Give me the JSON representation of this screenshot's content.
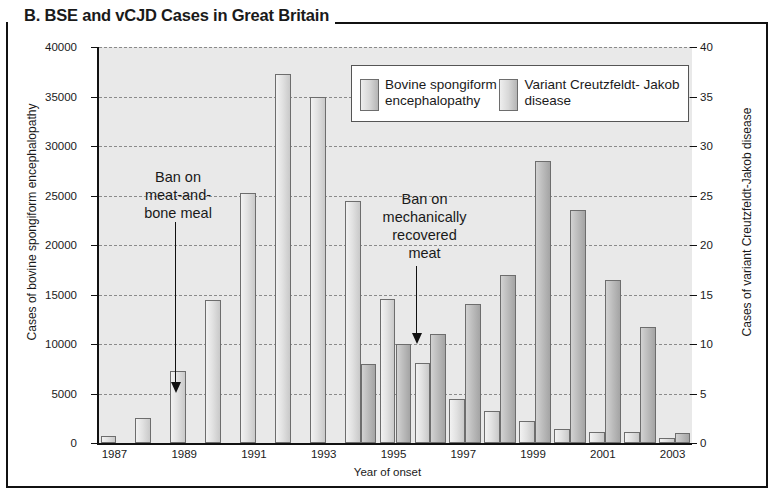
{
  "panel": {
    "title": "B. BSE and vCJD Cases in Great Britain"
  },
  "legend": {
    "items": [
      {
        "label": "Bovine spongiform\nencephalopathy",
        "key": "bse"
      },
      {
        "label": "Variant Creutzfeldt-\nJakob disease",
        "key": "vcjd"
      }
    ]
  },
  "annotations": [
    {
      "text": "Ban on\nmeat-and-\nbone meal",
      "name": "annotation-meat-and-bone-meal-ban",
      "year": 1988.6
    },
    {
      "text": "Ban on\nmechanically\nrecovered\nmeat",
      "name": "annotation-mechanically-recovered-meat-ban",
      "year": 1995.6
    }
  ],
  "chart_data": {
    "type": "bar",
    "title": "B. BSE and vCJD Cases in Great Britain",
    "xlabel": "Year of onset",
    "ylabel": "Cases of bovine spongiform encephalopathy",
    "ylabel_right": "Cases of variant Creutzfeldt-Jakob disease",
    "ylim": [
      0,
      40000
    ],
    "ylim_right": [
      0,
      40
    ],
    "yticks": [
      0,
      5000,
      10000,
      15000,
      20000,
      25000,
      30000,
      35000,
      40000
    ],
    "yticks_right": [
      0,
      5,
      10,
      15,
      20,
      25,
      30,
      35,
      40
    ],
    "xticks": [
      1987,
      1989,
      1991,
      1993,
      1995,
      1997,
      1999,
      2001,
      2003
    ],
    "grid": true,
    "legend_position": "top-right",
    "categories": [
      1987,
      1988,
      1989,
      1990,
      1991,
      1992,
      1993,
      1994,
      1995,
      1996,
      1997,
      1998,
      1999,
      2000,
      2001,
      2002,
      2003
    ],
    "series": [
      {
        "name": "Bovine spongiform encephalopathy",
        "axis": "left",
        "values": [
          750,
          2500,
          7250,
          14400,
          25300,
          37250,
          35000,
          24400,
          14500,
          8100,
          4400,
          3200,
          2250,
          1450,
          1100,
          1150,
          550
        ]
      },
      {
        "name": "Variant Creutzfeldt-Jakob disease",
        "axis": "right",
        "values": [
          0,
          0,
          0,
          0,
          0,
          0,
          0,
          8,
          10,
          11,
          14,
          17,
          28.5,
          23.5,
          16.5,
          11.7,
          1
        ]
      }
    ]
  }
}
